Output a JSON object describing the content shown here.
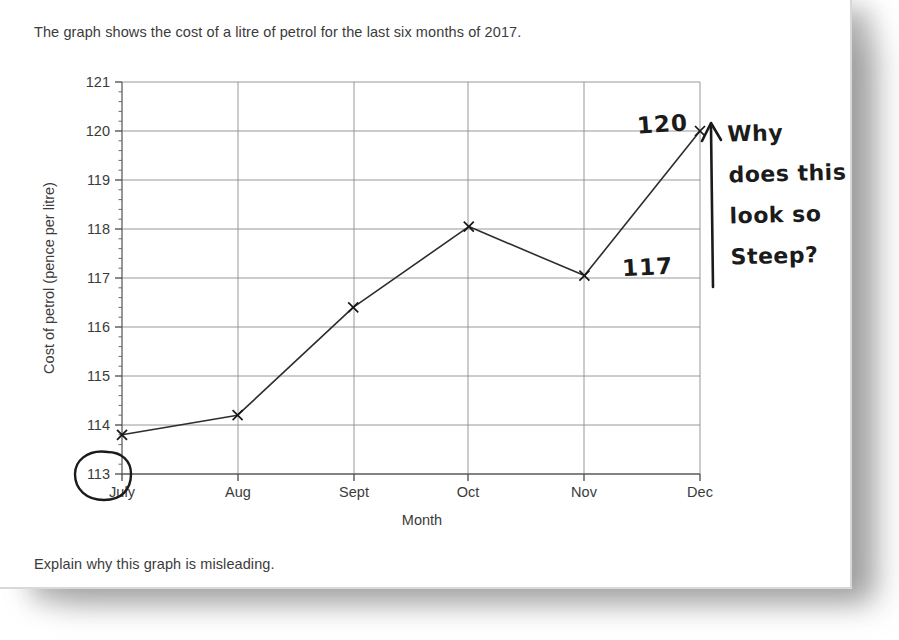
{
  "document": {
    "question_intro": "The graph shows the cost of a litre of petrol for the last six months of 2017.",
    "question_prompt": "Explain why this graph is misleading."
  },
  "chart_data": {
    "type": "line",
    "title": "",
    "xlabel": "Month",
    "ylabel": "Cost of petrol (pence per litre)",
    "categories": [
      "July",
      "Aug",
      "Sept",
      "Oct",
      "Nov",
      "Dec"
    ],
    "values": [
      113.8,
      114.2,
      116.4,
      118.05,
      117.05,
      120.0
    ],
    "ylim": [
      113,
      121
    ],
    "ytick_labels": [
      "113",
      "114",
      "115",
      "116",
      "117",
      "118",
      "119",
      "120",
      "121"
    ],
    "ytick_values": [
      113,
      114,
      115,
      116,
      117,
      118,
      119,
      120,
      121
    ],
    "minor_tick_interval": 0.2,
    "grid": true,
    "legend": "none",
    "marker": "x"
  },
  "annotations": {
    "value_label_dec": "120",
    "value_label_nov": "117",
    "note_lines": [
      "Why",
      "does this",
      "look so",
      "Steep?"
    ],
    "arrow": "up-arrow",
    "circled_tick": "113"
  },
  "colors": {
    "ink": "#1b1b1b",
    "print": "#3b3b3b",
    "grid": "#8d8d8d",
    "paper": "#ffffff"
  }
}
